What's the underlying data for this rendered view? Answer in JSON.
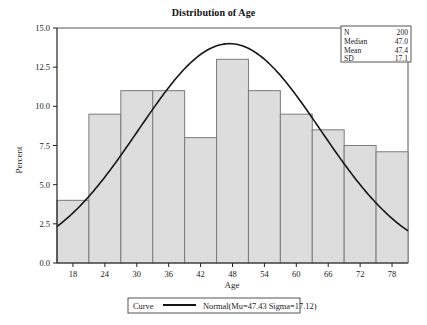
{
  "chart_data": {
    "type": "bar",
    "title": "Distribution of Age",
    "xlabel": "Age",
    "ylabel": "Percent",
    "categories": [
      18,
      24,
      30,
      36,
      42,
      48,
      54,
      60,
      66,
      72,
      78
    ],
    "values": [
      4.0,
      9.5,
      11.0,
      11.0,
      8.0,
      13.0,
      11.0,
      9.5,
      8.5,
      7.5,
      7.1
    ],
    "xlim": [
      15,
      81
    ],
    "ylim": [
      0.0,
      15.0
    ],
    "xticks": [
      "18",
      "24",
      "30",
      "36",
      "42",
      "48",
      "54",
      "60",
      "66",
      "72",
      "78"
    ],
    "yticks": [
      "0.0",
      "2.5",
      "5.0",
      "7.5",
      "10.0",
      "12.5",
      "15.0"
    ],
    "grid": false,
    "bin_width": 6,
    "series": [
      {
        "name": "Histogram",
        "values": [
          4.0,
          9.5,
          11.0,
          11.0,
          8.0,
          13.0,
          11.0,
          9.5,
          8.5,
          7.5,
          7.1
        ]
      },
      {
        "name": "Normal(Mu=47.43 Sigma=17.12)",
        "type": "line",
        "mu": 47.43,
        "sigma": 17.12,
        "peak_percent": 14.0
      }
    ],
    "legend": {
      "position": "bottom",
      "header": "Curve",
      "entry": "Normal(Mu=47.43 Sigma=17.12)"
    },
    "annotations": {
      "stats_box": [
        {
          "label": "N",
          "value": "200"
        },
        {
          "label": "Median",
          "value": "47.0"
        },
        {
          "label": "Mean",
          "value": "47.4"
        },
        {
          "label": "SD",
          "value": "17.1"
        }
      ]
    },
    "colors": {
      "bar_fill": "#dddddd",
      "bar_stroke": "#7b7b7b",
      "curve": "#151515",
      "text": "#222222",
      "background": "#ffffff"
    }
  },
  "legend": {
    "curve_label": "Curve",
    "normal_label": "Normal(Mu=47.43 Sigma=17.12)"
  },
  "stats": {
    "n_label": "N",
    "n_value": "200",
    "median_label": "Median",
    "median_value": "47.0",
    "mean_label": "Mean",
    "mean_value": "47.4",
    "sd_label": "SD",
    "sd_value": "17.1"
  },
  "axes": {
    "x_title": "Age",
    "y_title": "Percent",
    "x_ticks": [
      "18",
      "24",
      "30",
      "36",
      "42",
      "48",
      "54",
      "60",
      "66",
      "72",
      "78"
    ],
    "y_ticks": [
      "0.0",
      "2.5",
      "5.0",
      "7.5",
      "10.0",
      "12.5",
      "15.0"
    ]
  },
  "title": "Distribution of Age"
}
